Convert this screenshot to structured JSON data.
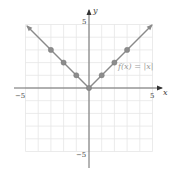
{
  "chart_data": {
    "type": "line",
    "title": "",
    "xlabel": "x",
    "ylabel": "y",
    "xlim": [
      -5,
      5
    ],
    "ylim": [
      -5,
      5
    ],
    "grid": true,
    "x_ticks_labeled": [
      -5,
      5
    ],
    "y_ticks_labeled": [
      -5,
      5
    ],
    "x_tick_labels": [
      "−5",
      "5"
    ],
    "y_tick_labels": [
      "5",
      "−5"
    ],
    "series": [
      {
        "name": "f(x) = |x|",
        "function": "abs(x)",
        "x": [
          -5,
          -3,
          -2,
          -1,
          0,
          1,
          2,
          3,
          5
        ],
        "y": [
          5,
          3,
          2,
          1,
          0,
          1,
          2,
          3,
          5
        ],
        "marked_points": [
          [
            -3,
            3
          ],
          [
            -2,
            2
          ],
          [
            -1,
            1
          ],
          [
            0,
            0
          ],
          [
            1,
            1
          ],
          [
            2,
            2
          ],
          [
            3,
            3
          ]
        ],
        "arrows_at_ends": true
      }
    ],
    "annotations": [
      {
        "text": "f(x) = |x|",
        "x": 2.3,
        "y": 2
      }
    ]
  },
  "labels": {
    "x_axis": "x",
    "y_axis": "y",
    "x_min": "−5",
    "x_max": "5",
    "y_max": "5",
    "y_min": "−5",
    "function": "f(x) = |x|"
  },
  "colors": {
    "curve": "#8a8a8a",
    "axis": "#6b6b6b",
    "grid": "#e6e6e6"
  }
}
